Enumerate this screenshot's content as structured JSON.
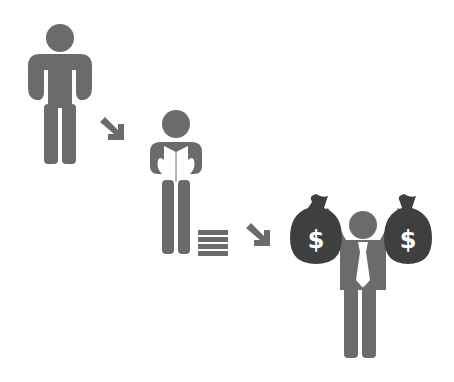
{
  "illustration": {
    "title": "From broke to rich through learning",
    "colors": {
      "figure": "#6b6b6b",
      "bag": "#3f3f3f",
      "background": "#ffffff",
      "highlight": "#ffffff"
    },
    "stages": [
      {
        "label": "Empty pockets",
        "icon": "poor-man-icon"
      },
      {
        "label": "Reading / studying",
        "icon": "reading-man-icon"
      },
      {
        "label": "Rich with money bags",
        "icon": "rich-man-icon"
      }
    ],
    "bag_symbol": "$"
  }
}
